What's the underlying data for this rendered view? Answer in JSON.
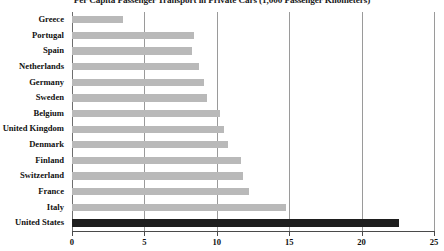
{
  "chart_data": {
    "type": "bar",
    "orientation": "horizontal",
    "title": "Per Capita Passenger Transport in Private Cars (1,000 Passenger Kilometers)",
    "xlabel": "",
    "ylabel": "",
    "xlim": [
      0,
      25
    ],
    "xticks": [
      0,
      5,
      10,
      15,
      20,
      25
    ],
    "xtick_labels": [
      "0",
      "5",
      "10",
      "15",
      "20",
      "25"
    ],
    "grid": "vertical",
    "legend": "none",
    "categories": [
      "Greece",
      "Portugal",
      "Spain",
      "Netherlands",
      "Germany",
      "Sweden",
      "Belgium",
      "United Kingdom",
      "Denmark",
      "Finland",
      "Switzerland",
      "France",
      "Italy",
      "United States"
    ],
    "values": [
      3.5,
      8.4,
      8.3,
      8.8,
      9.1,
      9.3,
      10.2,
      10.5,
      10.8,
      11.7,
      11.8,
      12.2,
      14.8,
      22.6
    ],
    "highlight_category": "United States",
    "colors": {
      "bar": "#b9b9b9",
      "bar_highlight": "#1e1e1e",
      "gridline": "#9a9a9a",
      "axis": "#4a4a4a",
      "text": "#111111",
      "background": "#ffffff"
    }
  }
}
